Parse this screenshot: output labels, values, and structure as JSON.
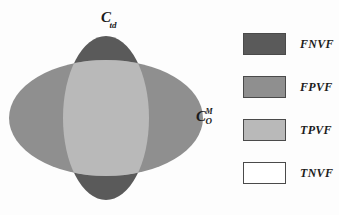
{
  "figure": {
    "type": "venn-diagram",
    "background_color": "#fdfdfd",
    "labels": {
      "top": {
        "symbol": "C",
        "subscript": "td",
        "full": "C_td"
      },
      "right": {
        "symbol": "C",
        "superscript": "M",
        "subscript": "O",
        "full": "C_O^M"
      }
    },
    "regions": [
      {
        "name": "vertical-ellipse",
        "region_code": "FNVF",
        "color": "#5a5a5a"
      },
      {
        "name": "horizontal-ellipse",
        "region_code": "FPVF",
        "color": "#8f8f8f"
      },
      {
        "name": "intersection",
        "region_code": "TPVF",
        "color": "#b9b9b9"
      },
      {
        "name": "background",
        "region_code": "TNVF",
        "color": "#ffffff"
      }
    ]
  },
  "legend": {
    "position": "right",
    "items": [
      {
        "label": "FNVF",
        "color": "#5a5a5a",
        "border": "#4a4a4a"
      },
      {
        "label": "FPVF",
        "color": "#8f8f8f",
        "border": "#4a4a4a"
      },
      {
        "label": "TPVF",
        "color": "#b9b9b9",
        "border": "#4a4a4a"
      },
      {
        "label": "TNVF",
        "color": "#ffffff",
        "border": "#4a4a4a"
      }
    ]
  }
}
